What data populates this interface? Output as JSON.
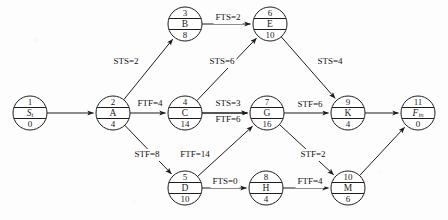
{
  "diagram": {
    "node_radius": 17,
    "nodes": [
      {
        "id": "1",
        "name": "S",
        "sub": "t",
        "italic": true,
        "duration": "0",
        "cx": 30,
        "cy": 113
      },
      {
        "id": "2",
        "name": "A",
        "sub": "",
        "italic": false,
        "duration": "4",
        "cx": 113,
        "cy": 113
      },
      {
        "id": "3",
        "name": "B",
        "sub": "",
        "italic": false,
        "duration": "8",
        "cx": 185,
        "cy": 24
      },
      {
        "id": "4",
        "name": "C",
        "sub": "",
        "italic": false,
        "duration": "14",
        "cx": 185,
        "cy": 113
      },
      {
        "id": "5",
        "name": "D",
        "sub": "",
        "italic": false,
        "duration": "10",
        "cx": 185,
        "cy": 188
      },
      {
        "id": "6",
        "name": "E",
        "sub": "",
        "italic": false,
        "duration": "10",
        "cx": 270,
        "cy": 24
      },
      {
        "id": "7",
        "name": "G",
        "sub": "",
        "italic": false,
        "duration": "16",
        "cx": 267,
        "cy": 113
      },
      {
        "id": "8",
        "name": "H",
        "sub": "",
        "italic": false,
        "duration": "4",
        "cx": 266,
        "cy": 188
      },
      {
        "id": "9",
        "name": "K",
        "sub": "",
        "italic": false,
        "duration": "4",
        "cx": 348,
        "cy": 113
      },
      {
        "id": "10",
        "name": "M",
        "sub": "",
        "italic": false,
        "duration": "6",
        "cx": 348,
        "cy": 188
      },
      {
        "id": "11",
        "name": "F",
        "sub": "in",
        "italic": true,
        "duration": "0",
        "cx": 418,
        "cy": 113
      }
    ],
    "edges": [
      {
        "from": "1",
        "to": "2",
        "label": "",
        "lx": 0,
        "ly": 0
      },
      {
        "from": "2",
        "to": "3",
        "label": "STS=2",
        "lx": 126,
        "ly": 62
      },
      {
        "from": "2",
        "to": "4",
        "label": "FTF=4",
        "lx": 150,
        "ly": 104
      },
      {
        "from": "2",
        "to": "5",
        "label": "STF=8",
        "lx": 147,
        "ly": 155
      },
      {
        "from": "3",
        "to": "6",
        "label": "FTS=2",
        "lx": 228,
        "ly": 18
      },
      {
        "from": "4",
        "to": "6",
        "label": "STS=6",
        "lx": 222,
        "ly": 62
      },
      {
        "from": "4",
        "to": "7",
        "label": "STS=3",
        "lx": 228,
        "ly": 104
      },
      {
        "from": "4",
        "to": "7b",
        "label": "FTF=6",
        "lx": 228,
        "ly": 120
      },
      {
        "from": "5",
        "to": "7",
        "label": "FTF=14",
        "lx": 195,
        "ly": 155
      },
      {
        "from": "5",
        "to": "8",
        "label": "FTS=0",
        "lx": 225,
        "ly": 182
      },
      {
        "from": "6",
        "to": "9",
        "label": "STS=4",
        "lx": 330,
        "ly": 62
      },
      {
        "from": "7",
        "to": "9",
        "label": "STF=6",
        "lx": 310,
        "ly": 105
      },
      {
        "from": "7",
        "to": "10",
        "label": "STF=2",
        "lx": 313,
        "ly": 155
      },
      {
        "from": "8",
        "to": "10",
        "label": "FTF=4",
        "lx": 310,
        "ly": 182
      },
      {
        "from": "9",
        "to": "11",
        "label": "",
        "lx": 0,
        "ly": 0
      },
      {
        "from": "10",
        "to": "11",
        "label": "",
        "lx": 0,
        "ly": 0
      }
    ]
  }
}
